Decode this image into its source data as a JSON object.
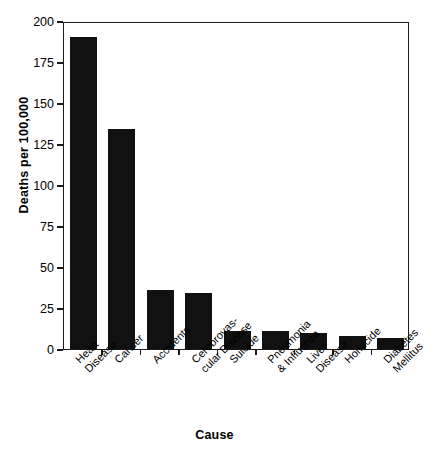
{
  "chart_data": {
    "type": "bar",
    "title": "",
    "xlabel": "Cause",
    "ylabel": "Deaths per 100,000",
    "categories": [
      "Heart\nDisease",
      "Cancer",
      "Accidents",
      "Cerebrovas-\ncular Disease",
      "Suicide",
      "Pneumonia\n& Influenza",
      "Liver\nDisease",
      "Homicide",
      "Diabetes\nMellitus"
    ],
    "values": [
      190,
      134,
      36,
      34,
      11,
      11,
      10,
      8,
      7
    ],
    "ylim": [
      0,
      200
    ],
    "yticks": [
      0,
      25,
      50,
      75,
      100,
      125,
      150,
      175,
      200
    ],
    "ytick_labels": [
      "0",
      "25",
      "50",
      "75",
      "100",
      "125",
      "150",
      "175",
      "200"
    ],
    "grid": false,
    "legend": false,
    "bar_color": "#111111",
    "frame_color": "#1a1a1a",
    "background": "#ffffff"
  }
}
